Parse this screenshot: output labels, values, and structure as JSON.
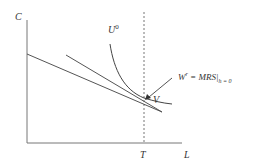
{
  "diagram": {
    "axes": {
      "y_label": "C",
      "x_label": "L"
    },
    "tick_labels": {
      "T": "T"
    },
    "curves": {
      "indifference_label": "U",
      "indifference_sup": "0"
    },
    "points": {
      "V": "V"
    },
    "annotation": {
      "main": "W",
      "sup": "r",
      "eq": " = MRS|",
      "sub": "h = 0"
    },
    "colors": {
      "axis": "#666666",
      "lines": "#555555",
      "dashed": "#777777",
      "text": "#333333"
    }
  }
}
